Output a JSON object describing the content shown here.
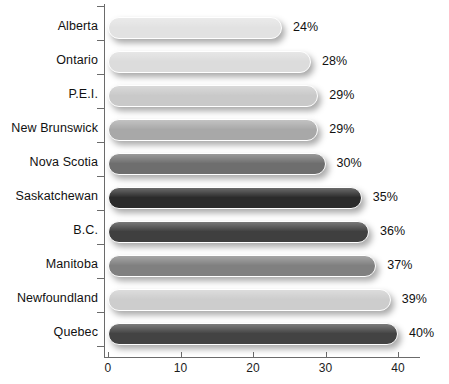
{
  "chart_data": {
    "type": "bar",
    "orientation": "horizontal",
    "title": "",
    "xlabel": "",
    "ylabel": "",
    "xlim": [
      0,
      44
    ],
    "xticks": [
      0,
      10,
      20,
      30,
      40
    ],
    "xtick_labels": [
      "0",
      "10",
      "20",
      "30",
      "40"
    ],
    "grid": false,
    "legend": null,
    "categories": [
      "Alberta",
      "Ontario",
      "P.E.I.",
      "New Brunswick",
      "Nova Scotia",
      "Saskatchewan",
      "B.C.",
      "Manitoba",
      "Newfoundland",
      "Quebec"
    ],
    "values": [
      24,
      28,
      29,
      29,
      30,
      35,
      36,
      37,
      39,
      40
    ],
    "value_labels": [
      "24%",
      "28%",
      "29%",
      "29%",
      "30%",
      "35%",
      "36%",
      "37%",
      "39%",
      "40%"
    ],
    "bar_colors": [
      "#e2e2e2",
      "#dcdcdc",
      "#c9c9c9",
      "#a8a8a8",
      "#6e6e6e",
      "#2b2b2b",
      "#3f3f3f",
      "#808080",
      "#cdcdcd",
      "#434343"
    ]
  },
  "caption": ""
}
